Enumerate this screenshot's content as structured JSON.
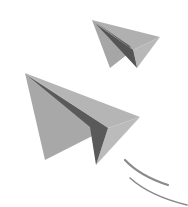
{
  "image": {
    "alt": "Two gray paper airplanes flying with motion lines",
    "background": "#ffffff"
  },
  "colors": {
    "wing_light": "#b3b3b3",
    "wing_mid": "#9e9e9e",
    "fold_dark": "#5a5a5a",
    "motion_line": "#8a8a8a"
  },
  "planes": [
    {
      "name": "small-plane"
    },
    {
      "name": "large-plane"
    }
  ]
}
